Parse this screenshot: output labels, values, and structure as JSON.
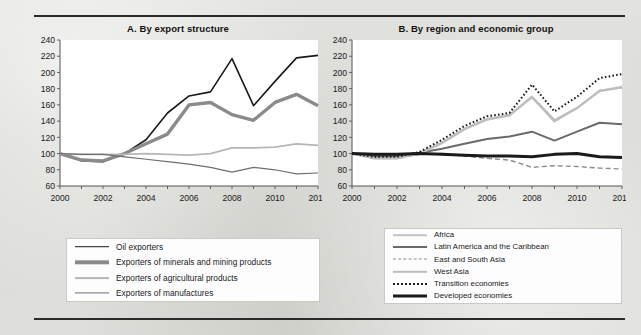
{
  "figure": {
    "background_color": "#dcdcd8",
    "rule_color": "#2a2a2a"
  },
  "panel_a": {
    "title": "A. By export structure",
    "legend": [
      {
        "label": "Oil exporters",
        "color": "#1a1a1a",
        "width": 1.6,
        "dash": "none"
      },
      {
        "label": "Exporters of minerals and mining products",
        "color": "#8a8a8a",
        "width": 3.4,
        "dash": "none"
      },
      {
        "label": "Exporters of agricultural products",
        "color": "#b6b6b6",
        "width": 1.8,
        "dash": "none"
      },
      {
        "label": "Exporters of manufactures",
        "color": "#6e6e6e",
        "width": 1.2,
        "dash": "none"
      }
    ]
  },
  "panel_b": {
    "title": "B. By region and economic group",
    "legend": [
      {
        "label": "Africa",
        "color": "#c2c2c2",
        "width": 1.6,
        "dash": "none"
      },
      {
        "label": "Latin America and the Caribbean",
        "color": "#6a6a6a",
        "width": 2.0,
        "dash": "none"
      },
      {
        "label": "East and South Asia",
        "color": "#8c8c8c",
        "width": 1.4,
        "dash": "5,3"
      },
      {
        "label": "West Asia",
        "color": "#bdbdbd",
        "width": 2.4,
        "dash": "none"
      },
      {
        "label": "Transition economies",
        "color": "#1a1a1a",
        "width": 2.0,
        "dash": "1.6,2.2"
      },
      {
        "label": "Developed economies",
        "color": "#1a1a1a",
        "width": 3.0,
        "dash": "none"
      }
    ]
  },
  "chart_data": [
    {
      "type": "line",
      "title": "A. By export structure",
      "xlabel": "",
      "ylabel": "",
      "x": [
        2000,
        2001,
        2002,
        2003,
        2004,
        2005,
        2006,
        2007,
        2008,
        2009,
        2010,
        2011,
        2012
      ],
      "xlim": [
        2000,
        2012
      ],
      "ylim": [
        60,
        240
      ],
      "yticks": [
        60,
        80,
        100,
        120,
        140,
        160,
        180,
        200,
        220,
        240
      ],
      "xticklabels": [
        "2000",
        "2002",
        "2004",
        "2006",
        "2008",
        "2010",
        "2012"
      ],
      "xtick_step": 1,
      "xticklabel_step": 2,
      "grid": false,
      "legend_position": "below",
      "series": [
        {
          "name": "Oil exporters",
          "values": [
            100,
            91,
            90,
            100,
            117,
            150,
            171,
            176,
            217,
            159,
            189,
            218,
            221
          ]
        },
        {
          "name": "Exporters of minerals and mining products",
          "values": [
            100,
            92,
            91,
            100,
            112,
            124,
            160,
            163,
            148,
            141,
            163,
            173,
            159
          ]
        },
        {
          "name": "Exporters of agricultural products",
          "values": [
            100,
            99,
            99,
            99,
            100,
            99,
            98,
            100,
            107,
            107,
            108,
            112,
            110
          ]
        },
        {
          "name": "Exporters of manufactures",
          "values": [
            100,
            99,
            99,
            96,
            93,
            90,
            87,
            83,
            77,
            83,
            80,
            75,
            76
          ]
        }
      ]
    },
    {
      "type": "line",
      "title": "B. By region and economic group",
      "xlabel": "",
      "ylabel": "",
      "x": [
        2000,
        2001,
        2002,
        2003,
        2004,
        2005,
        2006,
        2007,
        2008,
        2009,
        2010,
        2011,
        2012
      ],
      "xlim": [
        2000,
        2012
      ],
      "ylim": [
        60,
        240
      ],
      "yticks": [
        60,
        80,
        100,
        120,
        140,
        160,
        180,
        200,
        220,
        240
      ],
      "xticklabels": [
        "2000",
        "2002",
        "2004",
        "2006",
        "2008",
        "2010",
        "2012"
      ],
      "xtick_step": 1,
      "xticklabel_step": 2,
      "grid": false,
      "legend_position": "below",
      "series": [
        {
          "name": "Africa",
          "values": [
            100,
            94,
            94,
            101,
            114,
            131,
            143,
            148,
            169,
            139,
            156,
            178,
            181
          ]
        },
        {
          "name": "Latin America and the Caribbean",
          "values": [
            100,
            97,
            97,
            101,
            106,
            112,
            118,
            121,
            127,
            116,
            127,
            138,
            136
          ]
        },
        {
          "name": "East and South Asia",
          "values": [
            100,
            95,
            94,
            99,
            100,
            97,
            94,
            92,
            83,
            85,
            84,
            82,
            81
          ]
        },
        {
          "name": "West Asia",
          "values": [
            100,
            94,
            94,
            100,
            113,
            130,
            142,
            147,
            170,
            141,
            156,
            177,
            182
          ]
        },
        {
          "name": "Transition economies",
          "values": [
            100,
            96,
            96,
            102,
            117,
            134,
            146,
            150,
            185,
            152,
            170,
            193,
            198
          ]
        },
        {
          "name": "Developed economies",
          "values": [
            100,
            99,
            99,
            100,
            99,
            98,
            97,
            97,
            96,
            99,
            100,
            96,
            95
          ]
        }
      ]
    }
  ]
}
